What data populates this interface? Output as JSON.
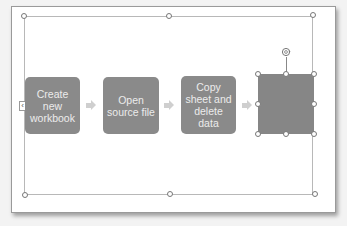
{
  "diagram": {
    "steps": [
      {
        "label": "Create new workbook"
      },
      {
        "label": "Open source file"
      },
      {
        "label": "Copy sheet and delete data"
      },
      {
        "label": ""
      }
    ],
    "text_pane_tab": "‹"
  },
  "colors": {
    "step_fill": "#8a8a8a",
    "selected_fill": "#868686",
    "arrow": "#cfcfcf",
    "step_text": "#ececec"
  }
}
